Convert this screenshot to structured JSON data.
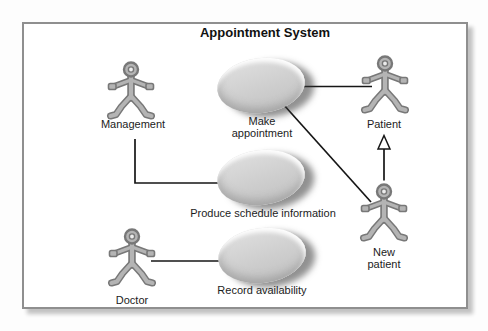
{
  "diagram": {
    "title": "Appointment System",
    "type": "uml-use-case-diagram",
    "colors": {
      "frame_border": "#8f8f8f",
      "connector_line": "#161616",
      "usecase_fill": "#cccccc",
      "actor_fill": "#b4b4b4",
      "actor_outline": "#787878",
      "label_text": "#1c1c1c"
    },
    "actors": [
      {
        "id": "management",
        "label": "Management"
      },
      {
        "id": "patient",
        "label": "Patient"
      },
      {
        "id": "new_patient",
        "label": "New patient"
      },
      {
        "id": "doctor",
        "label": "Doctor"
      }
    ],
    "use_cases": [
      {
        "id": "make_appointment",
        "label": "Make appointment"
      },
      {
        "id": "produce_schedule",
        "label": "Produce schedule information"
      },
      {
        "id": "record_availability",
        "label": "Record availability"
      }
    ],
    "relationships": [
      {
        "from": "Patient",
        "to": "Make appointment",
        "type": "association"
      },
      {
        "from": "New patient",
        "to": "Make appointment",
        "type": "association"
      },
      {
        "from": "Management",
        "to": "Produce schedule information",
        "type": "association"
      },
      {
        "from": "Doctor",
        "to": "Record availability",
        "type": "association"
      },
      {
        "from": "New patient",
        "to": "Patient",
        "type": "generalization"
      }
    ]
  }
}
